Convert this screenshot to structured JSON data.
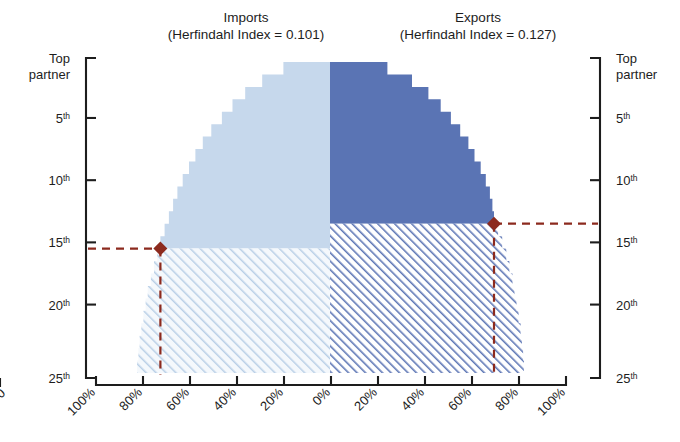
{
  "titles": {
    "imports_line1": "Imports",
    "imports_line2": "(Herfindahl Index = 0.101)",
    "exports_line1": "Exports",
    "exports_line2": "(Herfindahl Index = 0.127)"
  },
  "axes": {
    "y_left_label_top": "Top",
    "y_left_label_top2": "partner",
    "y_right_label_top": "Top",
    "y_right_label_top2": "partner",
    "y_ticks": [
      {
        "value": 1,
        "label": "Top partner",
        "num": "",
        "sup": ""
      },
      {
        "value": 5,
        "label": "5th",
        "num": "5",
        "sup": "th"
      },
      {
        "value": 10,
        "label": "10th",
        "num": "10",
        "sup": "th"
      },
      {
        "value": 15,
        "label": "15th",
        "num": "15",
        "sup": "th"
      },
      {
        "value": 20,
        "label": "20th",
        "num": "20",
        "sup": "th"
      },
      {
        "value": 25,
        "label": "25th",
        "num": "25",
        "sup": "th"
      }
    ],
    "x_ticks": [
      "100%",
      "80%",
      "60%",
      "40%",
      "20%",
      "0%",
      "20%",
      "40%",
      "60%",
      "80%",
      "100%"
    ],
    "x_values": [
      -100,
      -80,
      -60,
      -40,
      -20,
      0,
      20,
      40,
      60,
      80,
      100
    ]
  },
  "colors": {
    "imports_solid": "#c6d8ec",
    "imports_hatch_bg": "#f2f7fc",
    "imports_hatch_line": "#b7cee6",
    "exports_solid": "#5a74b4",
    "exports_hatch_bg": "#ffffff",
    "exports_hatch_line": "#5f78b6",
    "indicator": "#8c2a1e",
    "axis": "#1d1d1d"
  },
  "markers": {
    "imports": {
      "rank": 15,
      "share": 80,
      "label": "15th partner at 80%"
    },
    "exports": {
      "rank": 13,
      "share": 80,
      "label": "13th partner at 80%"
    }
  },
  "chart_data": {
    "type": "area",
    "subtitle": "",
    "xlabel": "",
    "ylabel": "Partner rank",
    "xlim": [
      -100,
      100
    ],
    "ylim": [
      0.5,
      25.5
    ],
    "grid": false,
    "legend": "none",
    "note": "Mirrored cumulative-share curves. Left half = Imports (negative x = share %), right half = Exports. Solid fill above the 80%-threshold marker rank, diagonal hatch below it.",
    "series": [
      {
        "name": "Imports",
        "side": "left",
        "herfindahl_index": 0.101,
        "threshold_rank": 15,
        "threshold_share": 80,
        "ranks": [
          1,
          2,
          3,
          4,
          5,
          6,
          7,
          8,
          9,
          10,
          11,
          12,
          13,
          14,
          15,
          16,
          17,
          18,
          19,
          20,
          21,
          22,
          23,
          24,
          25
        ],
        "cumulative_share": [
          22,
          32,
          40,
          46,
          51,
          56,
          60,
          63.5,
          66.5,
          69.5,
          72,
          74,
          76,
          78,
          80,
          81.5,
          83,
          84.5,
          86,
          87,
          88,
          89,
          89.8,
          90.4,
          91
        ]
      },
      {
        "name": "Exports",
        "side": "right",
        "herfindahl_index": 0.127,
        "threshold_rank": 13,
        "threshold_share": 80,
        "ranks": [
          1,
          2,
          3,
          4,
          5,
          6,
          7,
          8,
          9,
          10,
          11,
          12,
          13,
          14,
          15,
          16,
          17,
          18,
          19,
          20,
          21,
          22,
          23,
          24,
          25
        ],
        "cumulative_share": [
          28,
          40,
          48,
          54,
          59,
          63.5,
          67.5,
          70.5,
          73.5,
          76,
          78,
          79.2,
          80,
          82,
          84,
          86,
          87.5,
          89,
          90,
          91,
          92,
          93,
          93.6,
          94.2,
          94.6
        ]
      }
    ]
  }
}
